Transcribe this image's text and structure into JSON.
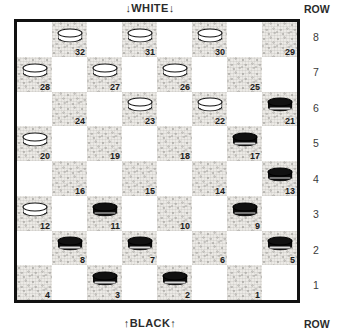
{
  "labels": {
    "white_side": "↓WHITE↓",
    "black_side": "↑BLACK↑",
    "row_header_top": "ROW",
    "row_header_bottom": "ROW"
  },
  "row_numbers": [
    "8",
    "7",
    "6",
    "5",
    "4",
    "3",
    "2",
    "1"
  ],
  "colors": {
    "dark_square": "#eceae6",
    "light_square": "#ffffff",
    "board_border": "#111111",
    "black_piece": "#0d0d0d",
    "white_piece": "#ffffff",
    "text": "#1c1c1c"
  },
  "board": {
    "rows": 8,
    "columns": 8,
    "numbering": "standard-checkers-32-squares",
    "squares": [
      {
        "num": "32",
        "row": 8,
        "col": 2,
        "shade": "dark",
        "piece": "white"
      },
      {
        "num": "31",
        "row": 8,
        "col": 4,
        "shade": "dark",
        "piece": "white"
      },
      {
        "num": "30",
        "row": 8,
        "col": 6,
        "shade": "dark",
        "piece": "white"
      },
      {
        "num": "29",
        "row": 8,
        "col": 8,
        "shade": "dark",
        "piece": null
      },
      {
        "num": "28",
        "row": 7,
        "col": 1,
        "shade": "dark",
        "piece": "white"
      },
      {
        "num": "27",
        "row": 7,
        "col": 3,
        "shade": "dark",
        "piece": "white"
      },
      {
        "num": "26",
        "row": 7,
        "col": 5,
        "shade": "dark",
        "piece": "white"
      },
      {
        "num": "25",
        "row": 7,
        "col": 7,
        "shade": "dark",
        "piece": null
      },
      {
        "num": "24",
        "row": 6,
        "col": 2,
        "shade": "dark",
        "piece": null
      },
      {
        "num": "23",
        "row": 6,
        "col": 4,
        "shade": "dark",
        "piece": "white"
      },
      {
        "num": "22",
        "row": 6,
        "col": 6,
        "shade": "dark",
        "piece": "white"
      },
      {
        "num": "21",
        "row": 6,
        "col": 8,
        "shade": "dark",
        "piece": "black"
      },
      {
        "num": "20",
        "row": 5,
        "col": 1,
        "shade": "dark",
        "piece": "white"
      },
      {
        "num": "19",
        "row": 5,
        "col": 3,
        "shade": "dark",
        "piece": null
      },
      {
        "num": "18",
        "row": 5,
        "col": 5,
        "shade": "dark",
        "piece": null
      },
      {
        "num": "17",
        "row": 5,
        "col": 7,
        "shade": "dark",
        "piece": "black"
      },
      {
        "num": "16",
        "row": 4,
        "col": 2,
        "shade": "dark",
        "piece": null
      },
      {
        "num": "15",
        "row": 4,
        "col": 4,
        "shade": "dark",
        "piece": null
      },
      {
        "num": "14",
        "row": 4,
        "col": 6,
        "shade": "dark",
        "piece": null
      },
      {
        "num": "13",
        "row": 4,
        "col": 8,
        "shade": "dark",
        "piece": "black"
      },
      {
        "num": "12",
        "row": 3,
        "col": 1,
        "shade": "dark",
        "piece": "white"
      },
      {
        "num": "11",
        "row": 3,
        "col": 3,
        "shade": "dark",
        "piece": "black"
      },
      {
        "num": "10",
        "row": 3,
        "col": 5,
        "shade": "dark",
        "piece": null
      },
      {
        "num": "9",
        "row": 3,
        "col": 7,
        "shade": "dark",
        "piece": "black"
      },
      {
        "num": "8",
        "row": 2,
        "col": 2,
        "shade": "dark",
        "piece": "black"
      },
      {
        "num": "7",
        "row": 2,
        "col": 4,
        "shade": "dark",
        "piece": "black"
      },
      {
        "num": "6",
        "row": 2,
        "col": 6,
        "shade": "dark",
        "piece": null
      },
      {
        "num": "5",
        "row": 2,
        "col": 8,
        "shade": "dark",
        "piece": "black"
      },
      {
        "num": "4",
        "row": 1,
        "col": 1,
        "shade": "dark",
        "piece": null
      },
      {
        "num": "3",
        "row": 1,
        "col": 3,
        "shade": "dark",
        "piece": "black"
      },
      {
        "num": "2",
        "row": 1,
        "col": 5,
        "shade": "dark",
        "piece": "black"
      },
      {
        "num": "1",
        "row": 1,
        "col": 7,
        "shade": "dark",
        "piece": null
      }
    ],
    "piece_counts": {
      "white": 10,
      "black": 12
    }
  }
}
